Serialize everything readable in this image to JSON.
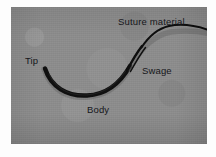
{
  "figure": {
    "kind": "photographic-plate",
    "plate_background_color": "#8d8d8d",
    "page_background_color": "#fdfdfd",
    "ink_color": "#15161a",
    "label_text_color": "#15161a"
  },
  "labels": {
    "suture_material": "Suture material",
    "tip": "Tip",
    "swage": "Swage",
    "body": "Body"
  },
  "parts": [
    {
      "id": "tip",
      "name": "Tip",
      "description": "fine tapering point at the left end of the curved needle"
    },
    {
      "id": "body",
      "name": "Body",
      "description": "thick black curved shaft forming the bottom of the needle arc"
    },
    {
      "id": "swage",
      "name": "Swage",
      "description": "crimped junction where the suture thread is attached to the needle end"
    },
    {
      "id": "suture_material",
      "name": "Suture material",
      "description": "thin thread running up and to the right away from the swage"
    }
  ]
}
